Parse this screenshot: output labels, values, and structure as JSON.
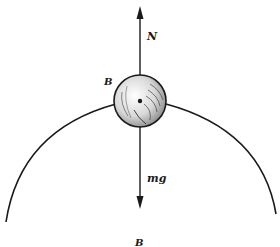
{
  "diagram": {
    "type": "free-body diagram",
    "labels": {
      "normal_force": "N",
      "weight": "mg",
      "ball": "B",
      "bottom": "B"
    },
    "colors": {
      "ink": "#1a1a1a",
      "background": "#ffffff"
    }
  }
}
